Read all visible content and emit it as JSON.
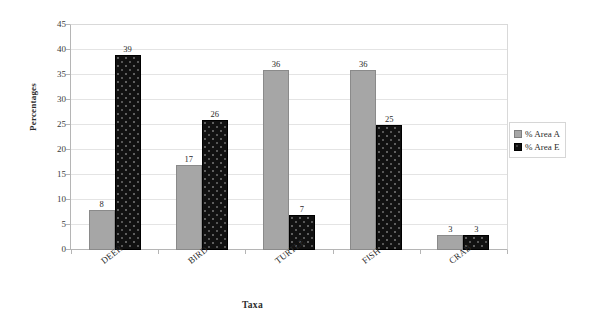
{
  "chart_data": {
    "type": "bar",
    "title": "",
    "xlabel": "Taxa",
    "ylabel": "Percentages",
    "categories": [
      "DEER",
      "BIRD",
      "TURTLE",
      "FISH",
      "CRAB"
    ],
    "series": [
      {
        "name": "% Area A",
        "color": "#a6a6a6",
        "values": [
          8,
          17,
          36,
          36,
          3
        ]
      },
      {
        "name": "% Area E",
        "color": "#111111",
        "values": [
          39,
          26,
          7,
          25,
          3
        ]
      }
    ],
    "ylim": [
      0,
      45
    ],
    "yticks": [
      0,
      5,
      10,
      15,
      20,
      25,
      30,
      35,
      40,
      45
    ],
    "ytick_labels": [
      "0",
      "5",
      "10",
      "15",
      "20",
      "25",
      "30",
      "35",
      "40",
      "45"
    ],
    "grid": true,
    "grid_axis": "y",
    "legend_position": "right",
    "data_labels": true,
    "xtick_label_rotation": -38
  }
}
